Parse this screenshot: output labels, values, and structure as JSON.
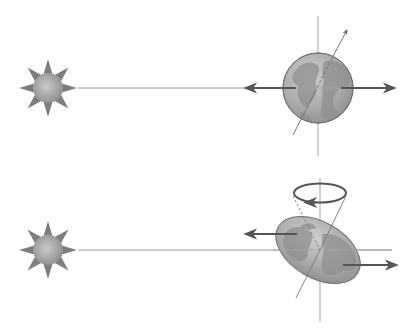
{
  "diagram": {
    "panels": [
      {
        "id": "top",
        "description": "Spherical Earth with tilted axis: opposing forces are collinear, no torque",
        "elements": [
          "sun",
          "sunlight-line",
          "earth-sphere",
          "vertical-axis",
          "tilted-rotation-axis",
          "force-arrow-left",
          "force-arrow-right"
        ]
      },
      {
        "id": "bottom",
        "description": "Oblate (bulging) Earth: offset forces produce torque, axis precesses",
        "elements": [
          "sun",
          "sunlight-line",
          "earth-oblate",
          "vertical-axis",
          "precessing-axis-cone",
          "precession-ring-arrow",
          "force-arrow-left",
          "force-arrow-right"
        ]
      }
    ]
  },
  "colors": {
    "background": "#ffffff",
    "sun_spike": "#7a7a7a",
    "sun_core": "#b5b5b5",
    "line": "#9a9a9a",
    "arrow": "#555555",
    "earth_fill": "#a8a8a8",
    "earth_land": "#8c8c8c",
    "earth_light": "#c8c8c8",
    "earth_stroke": "#6e6e6e"
  }
}
